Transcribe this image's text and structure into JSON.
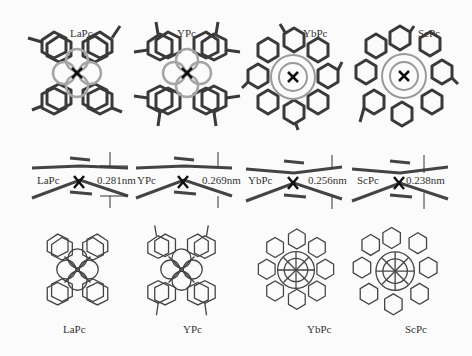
{
  "figure": {
    "rows": [
      {
        "name": "top-view-stick",
        "panels": [
          {
            "label": "LaPc",
            "x": 25,
            "y": 20
          },
          {
            "label": "YPc",
            "x": 133,
            "y": 20
          },
          {
            "label": "YbPc",
            "x": 240,
            "y": 20
          },
          {
            "label": "ScPc",
            "x": 350,
            "y": 20
          }
        ]
      },
      {
        "name": "side-view",
        "panels": [
          {
            "label": "LaPc",
            "distance": "0.281nm"
          },
          {
            "label": "YPc",
            "distance": "0.269nm"
          },
          {
            "label": "YbPc",
            "distance": "0.256nm"
          },
          {
            "label": "ScPc",
            "distance": "0.238nm"
          }
        ]
      },
      {
        "name": "top-view-wire",
        "panels": [
          {
            "label": "LaPc"
          },
          {
            "label": "YPc"
          },
          {
            "label": "YbPc"
          },
          {
            "label": "ScPc"
          }
        ]
      }
    ],
    "colors": {
      "bond_dark": "#3a3a3a",
      "bond_light": "#9a9a9a",
      "background": "#fbfbfb"
    }
  }
}
